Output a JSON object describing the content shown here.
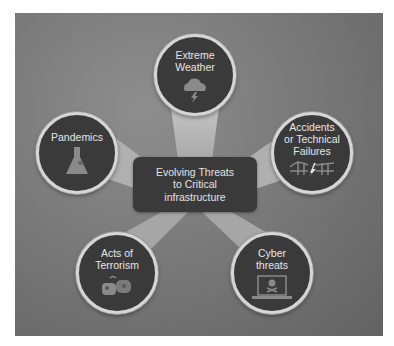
{
  "diagram": {
    "type": "hub-and-spoke",
    "center": {
      "label": "Evolving Threats\nto Critical\ninfrastructure"
    },
    "nodes": [
      {
        "id": "extreme-weather",
        "label": "Extreme\nWeather",
        "icon": "storm-cloud-icon"
      },
      {
        "id": "pandemics",
        "label": "Pandemics",
        "icon": "flask-icon"
      },
      {
        "id": "accidents",
        "label": "Accidents\nor Technical\nFailures",
        "icon": "broken-bridge-icon"
      },
      {
        "id": "terrorism",
        "label": "Acts of\nTerrorism",
        "icon": "explosion-icon"
      },
      {
        "id": "cyber",
        "label": "Cyber\nthreats",
        "icon": "laptop-skull-icon"
      }
    ]
  },
  "colors": {
    "panel": "#7a7a7a",
    "node_fill": "#3a3a3a",
    "node_border": "#d6d6d6",
    "beam": "#b4b4b4",
    "text": "#e6e6e6",
    "icon": "#8a8a8a"
  }
}
